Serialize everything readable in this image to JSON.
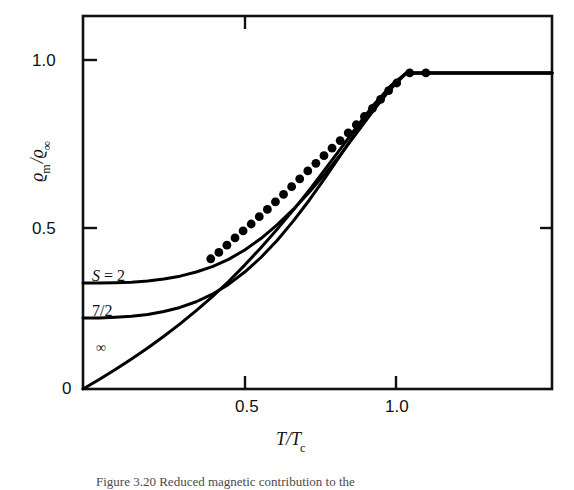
{
  "figure": {
    "caption": "Figure 3.20  Reduced magnetic contribution to the",
    "caption_label": "Figure 3.20"
  },
  "axes": {
    "x": {
      "title_main": "T/T",
      "title_sub": "c",
      "ticks": [
        "0.5",
        "1.0"
      ],
      "tick_values": [
        0.5,
        1.0
      ],
      "range": [
        0.0,
        1.45
      ],
      "origin_label": "0"
    },
    "y": {
      "title_main": "ϱ",
      "title_sub": "m",
      "title_sep": "/",
      "title_main2": "ϱ",
      "title_sub2": "∞",
      "ticks": [
        "0.5",
        "1.0"
      ],
      "tick_values": [
        0.5,
        1.0
      ],
      "range": [
        0.0,
        1.18
      ]
    }
  },
  "annotations": {
    "s2": {
      "symbol": "S",
      "equals": " = ",
      "value": "2"
    },
    "s72": "7/2",
    "sinf": "∞"
  },
  "colors": {
    "axis": "#111111",
    "curve": "#000000",
    "marker": "#000000",
    "background": "#ffffff",
    "text": "#111111"
  },
  "chart_data": {
    "type": "line",
    "title": "",
    "xlabel": "T/T_c",
    "ylabel": "rho_m / rho_inf",
    "xlim": [
      0.0,
      1.45
    ],
    "ylim": [
      0.0,
      1.18
    ],
    "grid": false,
    "legend": "in-plot curve labels",
    "series": [
      {
        "name": "S = 2",
        "style": "solid-line",
        "label": "S = 2",
        "x": [
          0.0,
          0.05,
          0.1,
          0.15,
          0.2,
          0.25,
          0.3,
          0.35,
          0.4,
          0.45,
          0.5,
          0.55,
          0.6,
          0.65,
          0.7,
          0.75,
          0.8,
          0.85,
          0.9,
          0.95,
          1.0,
          1.1,
          1.2,
          1.3,
          1.45
        ],
        "y": [
          0.335,
          0.335,
          0.336,
          0.338,
          0.342,
          0.348,
          0.357,
          0.37,
          0.387,
          0.41,
          0.44,
          0.476,
          0.519,
          0.568,
          0.623,
          0.683,
          0.747,
          0.815,
          0.884,
          0.948,
          1.0,
          1.0,
          1.0,
          1.0,
          1.0
        ]
      },
      {
        "name": "S = 7/2",
        "style": "solid-line",
        "label": "7/2",
        "x": [
          0.0,
          0.05,
          0.1,
          0.15,
          0.2,
          0.25,
          0.3,
          0.35,
          0.4,
          0.45,
          0.5,
          0.55,
          0.6,
          0.65,
          0.7,
          0.75,
          0.8,
          0.85,
          0.9,
          0.95,
          1.0,
          1.1,
          1.2,
          1.3,
          1.45
        ],
        "y": [
          0.225,
          0.225,
          0.227,
          0.23,
          0.236,
          0.245,
          0.258,
          0.276,
          0.3,
          0.331,
          0.37,
          0.416,
          0.47,
          0.531,
          0.598,
          0.67,
          0.745,
          0.822,
          0.897,
          0.957,
          1.0,
          1.0,
          1.0,
          1.0,
          1.0
        ]
      },
      {
        "name": "S = infinity",
        "style": "solid-line",
        "label": "∞",
        "x": [
          0.0,
          0.05,
          0.1,
          0.15,
          0.2,
          0.25,
          0.3,
          0.35,
          0.4,
          0.45,
          0.5,
          0.55,
          0.6,
          0.65,
          0.7,
          0.75,
          0.8,
          0.85,
          0.9,
          0.95,
          1.0,
          1.1,
          1.2,
          1.3,
          1.45
        ],
        "y": [
          0.0,
          0.03,
          0.062,
          0.095,
          0.13,
          0.167,
          0.206,
          0.248,
          0.292,
          0.34,
          0.392,
          0.447,
          0.505,
          0.566,
          0.63,
          0.697,
          0.765,
          0.835,
          0.901,
          0.957,
          1.0,
          1.0,
          1.0,
          1.0,
          1.0
        ]
      },
      {
        "name": "experimental data",
        "style": "filled-circles",
        "x": [
          0.395,
          0.42,
          0.445,
          0.47,
          0.495,
          0.52,
          0.545,
          0.57,
          0.595,
          0.62,
          0.645,
          0.67,
          0.695,
          0.72,
          0.745,
          0.77,
          0.795,
          0.82,
          0.845,
          0.87,
          0.895,
          0.92,
          0.945,
          0.97,
          1.01,
          1.06
        ],
        "y": [
          0.412,
          0.432,
          0.455,
          0.478,
          0.5,
          0.522,
          0.545,
          0.568,
          0.592,
          0.616,
          0.64,
          0.665,
          0.69,
          0.714,
          0.738,
          0.762,
          0.786,
          0.81,
          0.836,
          0.862,
          0.888,
          0.916,
          0.944,
          0.968,
          1.0,
          1.0
        ]
      }
    ]
  }
}
